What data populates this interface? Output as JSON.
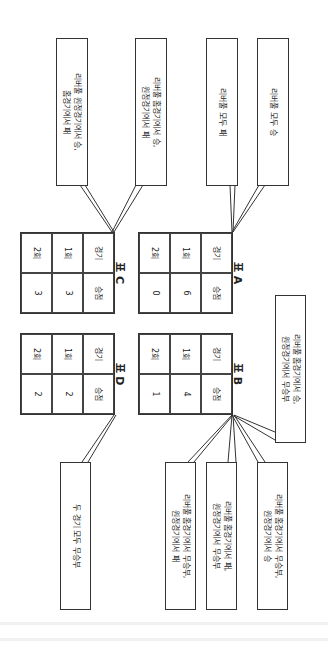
{
  "top_callouts": [
    {
      "text": "리버풀 원정경기에서 승,\n홈경기에서 패"
    },
    {
      "text": "리버풀 홈경기에서 승,\n원정경기에서 패"
    },
    {
      "text": "리버풀 모두 패"
    },
    {
      "text": "리버풀 모두 승"
    }
  ],
  "tables": {
    "header": {
      "col1": "경기",
      "col2": "승점"
    },
    "rows": [
      "1회",
      "2회"
    ],
    "A": {
      "label": "표 A",
      "values": [
        "6",
        "0"
      ]
    },
    "B": {
      "label": "표 B",
      "values": [
        "4",
        "1"
      ]
    },
    "C": {
      "label": "표 C",
      "values": [
        "3",
        "3"
      ]
    },
    "D": {
      "label": "표 D",
      "values": [
        "2",
        "2"
      ]
    }
  },
  "right_callout": {
    "text": "리버풀 홈경기에서 승,\n원정경기에서 무승부"
  },
  "bottom_callouts": [
    {
      "text": "두 경기 모두 무승부"
    },
    {
      "text": "리버풀 홈경기에서 무승부,\n원정경기에서 패"
    },
    {
      "text": "리버풀 홈경기에서 패,\n원정경기에서 무승부"
    },
    {
      "text": "리버풀 홈경기에서 무승부,\n원정경기에서 승"
    }
  ]
}
